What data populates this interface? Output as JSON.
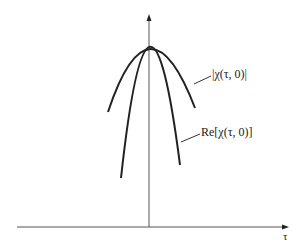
{
  "diagram": {
    "axes": {
      "x_label": "τ",
      "y_label": ""
    },
    "curves": [
      {
        "name": "magnitude",
        "label": "|χ(τ, 0)|"
      },
      {
        "name": "real-part",
        "label": "Re[χ(τ, 0)]"
      }
    ],
    "colors": {
      "line": "#222222",
      "axis": "#555555",
      "background": "#ffffff"
    }
  }
}
